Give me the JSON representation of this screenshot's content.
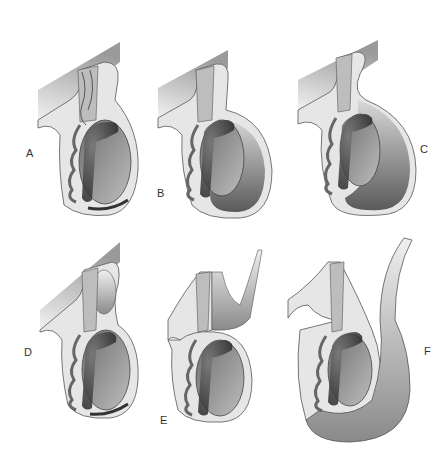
{
  "figure": {
    "panels": [
      {
        "id": "A",
        "label": "A"
      },
      {
        "id": "B",
        "label": "B"
      },
      {
        "id": "C",
        "label": "C"
      },
      {
        "id": "D",
        "label": "D"
      },
      {
        "id": "E",
        "label": "E"
      },
      {
        "id": "F",
        "label": "F"
      }
    ]
  },
  "colors": {
    "outline": "#555555",
    "skin": "#e6e6e6",
    "dark": "#3a3a3a",
    "mid": "#8a8a8a",
    "light": "#cfcfcf"
  }
}
